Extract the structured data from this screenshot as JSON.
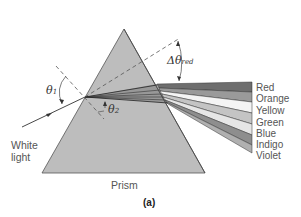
{
  "figure": {
    "caption": "(a)",
    "prism_label": "Prism",
    "incident_label_line1": "White",
    "incident_label_line2": "light",
    "theta1": {
      "symbol": "θ",
      "subscript": "1"
    },
    "theta2": {
      "symbol": "θ",
      "subscript": "2"
    },
    "delta_theta": {
      "symbol": "Δθ",
      "subscript": "red"
    },
    "bands": [
      {
        "label": "Red",
        "color": "#6e6e6e"
      },
      {
        "label": "Orange",
        "color": "#9a9a9a"
      },
      {
        "label": "Yellow",
        "color": "#f4f4f4"
      },
      {
        "label": "Green",
        "color": "#c4c4c4"
      },
      {
        "label": "Blue",
        "color": "#e6e6e6"
      },
      {
        "label": "Indigo",
        "color": "#8e8e8e"
      },
      {
        "label": "Violet",
        "color": "#b0b0b0"
      }
    ],
    "colors": {
      "prism_fill": "#bdbdbd",
      "line": "#333333"
    }
  }
}
